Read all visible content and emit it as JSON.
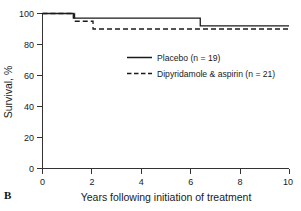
{
  "panel": {
    "label": "B"
  },
  "chart_data": {
    "type": "line",
    "title": "",
    "subtitle": "",
    "xlabel": "Years following initiation of treatment",
    "ylabel": "Survival, %",
    "xlim": [
      0,
      10
    ],
    "ylim": [
      0,
      100
    ],
    "xticks": [
      0,
      2,
      4,
      6,
      8,
      10
    ],
    "xtick_labels": [
      "0",
      "2",
      "4",
      "6",
      "8",
      "10"
    ],
    "yticks": [
      0,
      20,
      40,
      60,
      80,
      100
    ],
    "ytick_labels": [
      "0",
      "20",
      "40",
      "60",
      "80",
      "100"
    ],
    "grid": false,
    "legend_position": "center",
    "style": "kaplan-meier step survival curves",
    "series": [
      {
        "name": "Placebo (n = 19)",
        "legend_label": "Placebo (n = 19)",
        "group": "Placebo",
        "n": 19,
        "linestyle": "solid",
        "color": "#1a1a1a",
        "steps": [
          {
            "x": 0.0,
            "y": 100
          },
          {
            "x": 1.25,
            "y": 100
          },
          {
            "x": 1.25,
            "y": 97
          },
          {
            "x": 6.4,
            "y": 97
          },
          {
            "x": 6.4,
            "y": 92
          },
          {
            "x": 10.0,
            "y": 92
          }
        ],
        "x": [
          0.0,
          1.25,
          1.25,
          6.4,
          6.4,
          10.0
        ],
        "y": [
          100,
          100,
          97,
          97,
          92,
          92
        ]
      },
      {
        "name": "Dipyridamole & aspirin (n = 21)",
        "legend_label": "Dipyridamole & aspirin (n = 21)",
        "group": "Dipyridamole & aspirin",
        "n": 21,
        "linestyle": "dashed",
        "color": "#1a1a1a",
        "steps": [
          {
            "x": 0.0,
            "y": 100
          },
          {
            "x": 1.3,
            "y": 100
          },
          {
            "x": 1.3,
            "y": 95
          },
          {
            "x": 2.05,
            "y": 95
          },
          {
            "x": 2.05,
            "y": 90
          },
          {
            "x": 10.0,
            "y": 90
          }
        ],
        "x": [
          0.0,
          1.3,
          1.3,
          2.05,
          2.05,
          10.0
        ],
        "y": [
          100,
          100,
          95,
          95,
          90,
          90
        ]
      }
    ],
    "annotations": []
  }
}
